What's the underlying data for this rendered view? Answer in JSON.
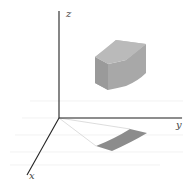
{
  "diagram": {
    "type": "3d-coordinate-region",
    "axes": {
      "x_label": "x",
      "y_label": "y",
      "z_label": "z"
    },
    "colors": {
      "axis": "#222222",
      "grid": "#e6e6e6",
      "solid_front": "#a6a6a6",
      "solid_top": "#bdbdbd",
      "solid_side": "#9a9a9a",
      "shadow": "#8c8c8c",
      "projection_lines": "#cccccc"
    },
    "elements": [
      {
        "name": "curved-box-solid",
        "description": "Cylindrical wedge region above the xy-plane"
      },
      {
        "name": "projection-region",
        "description": "Shaded projection of the solid onto the xy-plane"
      },
      {
        "name": "projection-lines",
        "description": "Radial lines from origin bounding the projection"
      }
    ]
  }
}
